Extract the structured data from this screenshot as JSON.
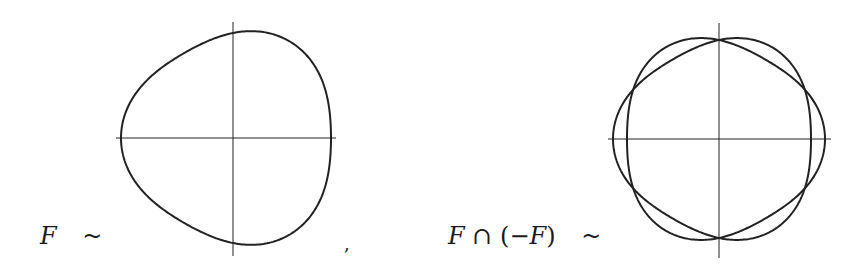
{
  "figures": [
    {
      "id": "F",
      "label_parts": [
        {
          "text": "F",
          "italic": true
        }
      ],
      "relation": "~",
      "center": [
        233,
        138
      ],
      "axes": {
        "x_range": [
          116,
          336
        ],
        "y_range": [
          22,
          256
        ]
      },
      "curve": {
        "base_radius": 105,
        "amp3": 7,
        "phase_sign": -1
      },
      "curves": [
        "F"
      ]
    },
    {
      "id": "F-cap-minus-F",
      "label_parts": [
        {
          "text": "F",
          "italic": true
        },
        {
          "text": " ∩ (−",
          "italic": false
        },
        {
          "text": "F",
          "italic": true
        },
        {
          "text": ")",
          "italic": false
        }
      ],
      "relation": "~",
      "center": [
        719,
        139
      ],
      "axes": {
        "x_range": [
          608,
          831
        ],
        "y_range": [
          23,
          258
        ]
      },
      "curve": {
        "base_radius": 99,
        "amp3": 7,
        "phase_sign": 1
      },
      "curves": [
        "F",
        "-F"
      ]
    }
  ],
  "separator": ",",
  "line_color": "#222222"
}
